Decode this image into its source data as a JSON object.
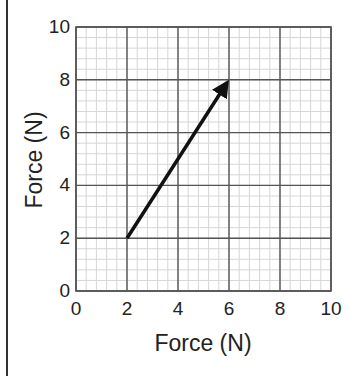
{
  "chart_data": {
    "type": "vector",
    "title": "",
    "xlabel": "Force (N)",
    "ylabel": "Force (N)",
    "xlim": [
      0,
      10
    ],
    "ylim": [
      0,
      10
    ],
    "x_ticks": [
      "0",
      "2",
      "4",
      "6",
      "8",
      "10"
    ],
    "y_ticks": [
      "0",
      "2",
      "4",
      "6",
      "8",
      "10"
    ],
    "grid": {
      "major_step": 2,
      "minor_step": 0.4
    },
    "vector": {
      "tail": [
        2,
        2
      ],
      "head": [
        6,
        8
      ],
      "color": "#111111"
    }
  },
  "axes": {
    "x_label": "Force (N)",
    "y_label": "Force (N)"
  }
}
